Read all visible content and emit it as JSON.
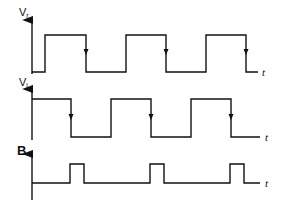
{
  "diagram": {
    "type": "timing-diagram",
    "colors": {
      "line": "#111111",
      "background": "#ffffff"
    },
    "traces": [
      {
        "id": "vr",
        "label_main": "V",
        "label_sub": "r",
        "time_label": "t",
        "axis_x": 32,
        "axis_top": 14,
        "axis_bottom": 74,
        "low_y": 72,
        "high_y": 35,
        "points": [
          [
            32,
            72
          ],
          [
            45,
            72
          ],
          [
            45,
            35
          ],
          [
            86,
            35
          ],
          [
            86,
            72
          ],
          [
            126,
            72
          ],
          [
            126,
            35
          ],
          [
            166,
            35
          ],
          [
            166,
            72
          ],
          [
            206,
            72
          ],
          [
            206,
            35
          ],
          [
            246,
            35
          ],
          [
            246,
            72
          ],
          [
            258,
            72
          ]
        ],
        "arrows": [
          [
            86,
            52
          ],
          [
            166,
            52
          ],
          [
            246,
            52
          ]
        ],
        "t_pos": [
          262,
          76
        ]
      },
      {
        "id": "vi",
        "label_main": "V",
        "label_sub": "i",
        "time_label": "t",
        "axis_x": 32,
        "axis_top": 83,
        "axis_bottom": 140,
        "low_y": 137,
        "high_y": 99,
        "points": [
          [
            32,
            99
          ],
          [
            71,
            99
          ],
          [
            71,
            137
          ],
          [
            111,
            137
          ],
          [
            111,
            99
          ],
          [
            151,
            99
          ],
          [
            151,
            137
          ],
          [
            191,
            137
          ],
          [
            191,
            99
          ],
          [
            231,
            99
          ],
          [
            231,
            137
          ],
          [
            260,
            137
          ]
        ],
        "arrows": [
          [
            71,
            117
          ],
          [
            151,
            117
          ],
          [
            231,
            117
          ]
        ],
        "t_pos": [
          265,
          141
        ]
      },
      {
        "id": "b",
        "label_main": "B",
        "label_sub": "",
        "time_label": "t",
        "axis_x": 32,
        "axis_top": 148,
        "axis_bottom": 200,
        "low_y": 183,
        "high_y": 164,
        "points": [
          [
            32,
            183
          ],
          [
            70,
            183
          ],
          [
            70,
            164
          ],
          [
            84,
            164
          ],
          [
            84,
            183
          ],
          [
            150,
            183
          ],
          [
            150,
            164
          ],
          [
            164,
            164
          ],
          [
            164,
            183
          ],
          [
            230,
            183
          ],
          [
            230,
            164
          ],
          [
            244,
            164
          ],
          [
            244,
            183
          ],
          [
            260,
            183
          ]
        ],
        "arrows": [],
        "t_pos": [
          265,
          187
        ]
      }
    ]
  }
}
